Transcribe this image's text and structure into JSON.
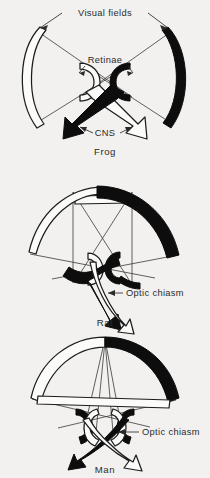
{
  "figure": {
    "background_color": "#f2f1ef",
    "ink_color": "#0d0d0d",
    "paper_color": "#fbfbfa"
  },
  "annotations": {
    "visual_fields": "Visual fields",
    "retinae": "Retinae",
    "cns": "CNS",
    "optic_chiasm_rat": "Optic chiasm",
    "optic_chiasm_man": "Optic chiasm"
  },
  "panels": [
    {
      "id": "frog",
      "caption": "Frog",
      "field_left_color": "#fbfbfa",
      "field_right_color": "#0d0d0d",
      "binocular_overlap": "none",
      "decussation": "complete",
      "labels": [
        "Visual fields",
        "Retinae",
        "CNS"
      ]
    },
    {
      "id": "rat",
      "caption": "Rat",
      "field_left_color": "#fbfbfa",
      "field_right_color": "#0d0d0d",
      "binocular_overlap": "small",
      "decussation": "mostly crossed",
      "labels": [
        "Optic chiasm"
      ]
    },
    {
      "id": "man",
      "caption": "Man",
      "field_left_color": "#fbfbfa",
      "field_right_color": "#0d0d0d",
      "binocular_overlap": "large",
      "decussation": "hemidecussation",
      "labels": [
        "Optic chiasm"
      ]
    }
  ]
}
